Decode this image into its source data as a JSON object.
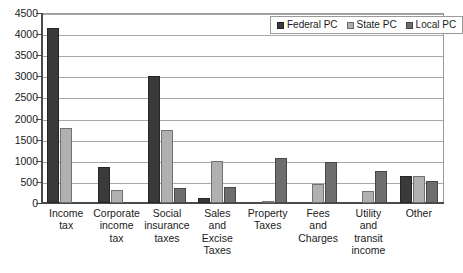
{
  "chart_data": {
    "type": "bar",
    "title": "",
    "xlabel": "",
    "ylabel": "",
    "ylim": [
      0,
      4500
    ],
    "ytick_step": 500,
    "yticks": [
      4500,
      4000,
      3500,
      3000,
      2500,
      2000,
      1500,
      1000,
      500,
      0
    ],
    "grid": true,
    "legend_position": "top-right",
    "categories": [
      "Income tax",
      "Corporate income tax",
      "Social insurance taxes",
      "Sales and Excise Taxes",
      "Property Taxes",
      "Fees and Charges",
      "Utility and transit income",
      "Other"
    ],
    "category_lines": [
      [
        "Income",
        "tax"
      ],
      [
        "Corporate",
        "income",
        "tax"
      ],
      [
        "Social",
        "insurance",
        "taxes"
      ],
      [
        "Sales",
        "and",
        "Excise",
        "Taxes"
      ],
      [
        "Property",
        "Taxes"
      ],
      [
        "Fees",
        "and",
        "Charges"
      ],
      [
        "Utility",
        "and",
        "transit",
        "income"
      ],
      [
        "Other"
      ]
    ],
    "series": [
      {
        "name": "Federal PC",
        "color": "#3a3a3a",
        "values": [
          4150,
          860,
          3000,
          120,
          0,
          0,
          0,
          640
        ]
      },
      {
        "name": "State PC",
        "color": "#b0b0b0",
        "values": [
          1780,
          300,
          1720,
          1000,
          50,
          440,
          280,
          650
        ]
      },
      {
        "name": "Local PC",
        "color": "#6e6e6e",
        "values": [
          0,
          0,
          360,
          390,
          1060,
          960,
          770,
          510
        ]
      }
    ]
  }
}
